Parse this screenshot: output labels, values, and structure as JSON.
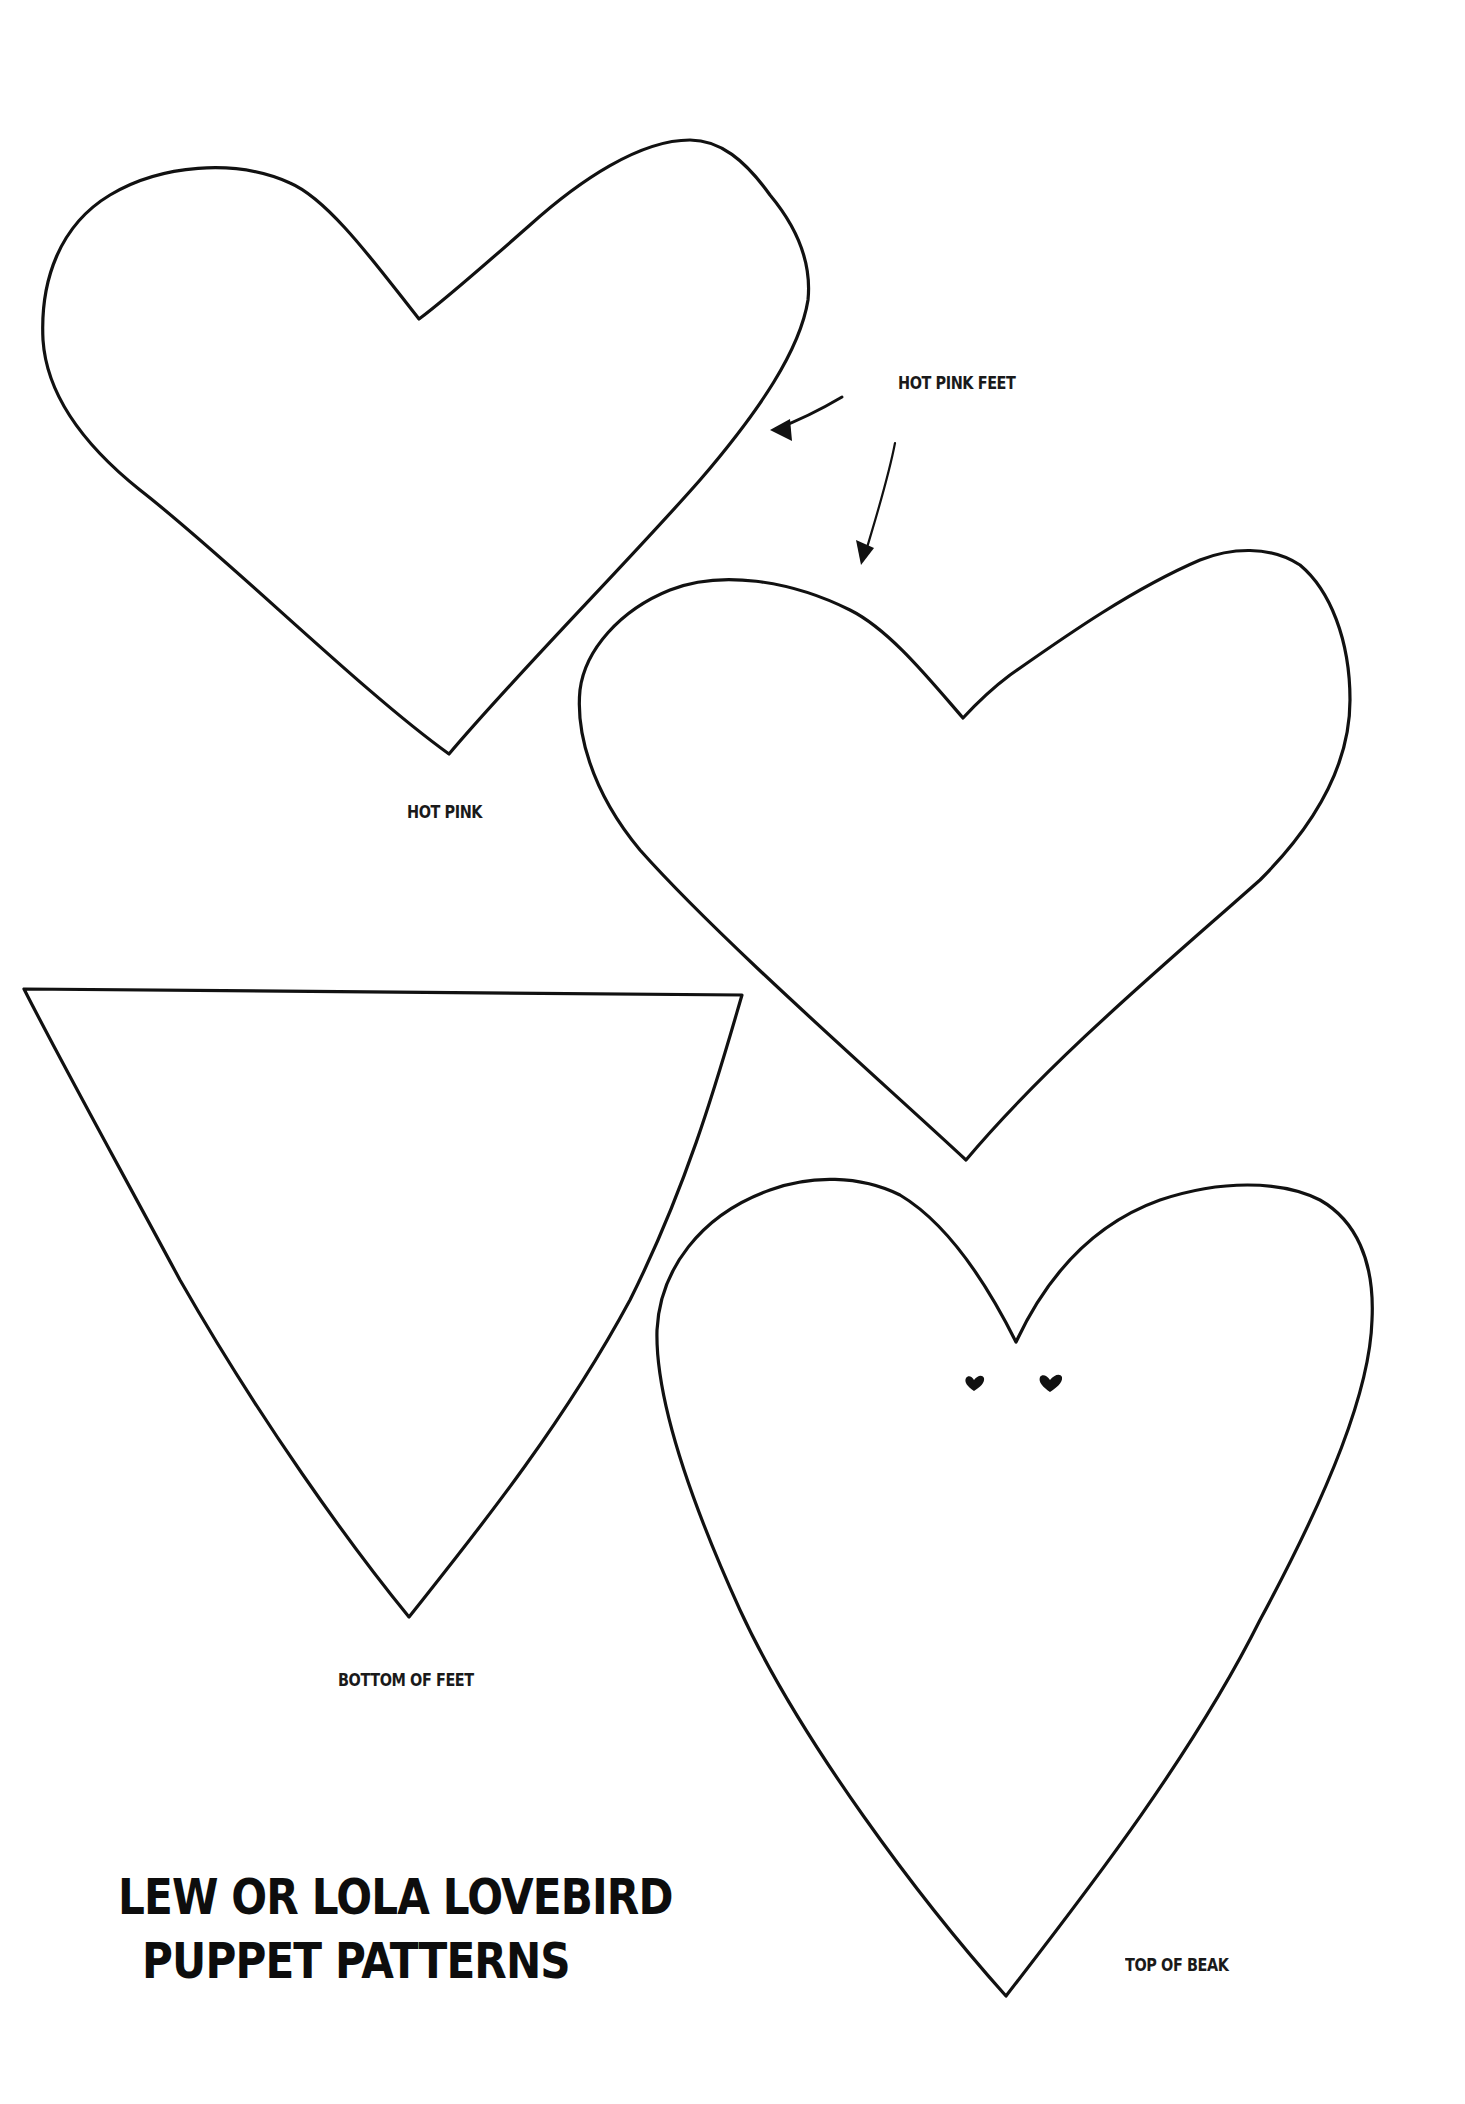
{
  "page": {
    "title_lines": [
      "LEW OR LOLA LOVEBIRD",
      "PUPPET PATTERNS"
    ],
    "labels": {
      "hot_pink_feet": "HOT PINK FEET",
      "hot_pink": "HOT PINK",
      "bottom_of_feet": "BOTTOM OF FEET",
      "top_of_beak": "TOP OF BEAK"
    },
    "shapes": [
      {
        "name": "heart-large-left",
        "type": "heart"
      },
      {
        "name": "heart-right",
        "type": "heart"
      },
      {
        "name": "triangle-bottom-of-feet",
        "type": "triangle"
      },
      {
        "name": "heart-beak",
        "type": "heart",
        "decoration": "two small heart eyes"
      }
    ],
    "colors": {
      "line": "#111111",
      "background": "#ffffff"
    }
  }
}
